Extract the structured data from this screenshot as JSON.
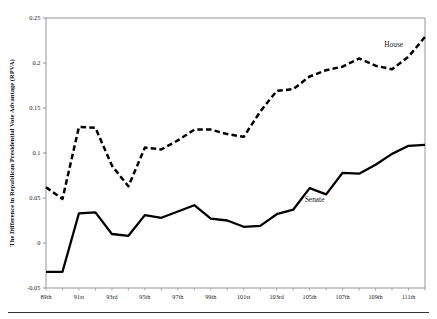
{
  "figure": {
    "name": "rpva-house-senate-line-chart",
    "bottom_rule": true
  },
  "chart_data": {
    "type": "line",
    "title": "",
    "subtitle": "",
    "xlabel": "",
    "ylabel": "The Difference in Republican Presidential Vote Advantage (RPVA)",
    "categories": [
      "89th",
      "90th",
      "91st",
      "92nd",
      "93rd",
      "94th",
      "95th",
      "96th",
      "97th",
      "98th",
      "99th",
      "100th",
      "101st",
      "102nd",
      "103rd",
      "104th",
      "105th",
      "106th",
      "107th",
      "108th",
      "109th",
      "110th",
      "111th",
      "112th"
    ],
    "x_tick_labels": [
      "89th",
      "91st",
      "93rd",
      "95th",
      "97th",
      "99th",
      "101st",
      "103rd",
      "105th",
      "107th",
      "109th",
      "111th"
    ],
    "x_tick_indices": [
      0,
      2,
      4,
      6,
      8,
      10,
      12,
      14,
      16,
      18,
      20,
      22
    ],
    "y_tick_labels": [
      "0.25",
      "0.2",
      "0.15",
      "0.1",
      "0.05",
      "0",
      "-0.05"
    ],
    "y_tick_values": [
      0.25,
      0.2,
      0.15,
      0.1,
      0.05,
      0,
      -0.05
    ],
    "ylim": [
      -0.05,
      0.25
    ],
    "grid": false,
    "legend_position": "inline-annotation",
    "series": [
      {
        "name": "House",
        "style": "dashed",
        "color": "#000000",
        "label_x_index": 21.1,
        "label_y": 0.218,
        "values": [
          0.062,
          0.049,
          0.129,
          0.128,
          0.086,
          0.063,
          0.106,
          0.104,
          0.114,
          0.126,
          0.126,
          0.121,
          0.118,
          0.146,
          0.169,
          0.171,
          0.185,
          0.192,
          0.196,
          0.205,
          0.197,
          0.193,
          0.207,
          0.229
        ]
      },
      {
        "name": "Senate",
        "style": "solid",
        "color": "#000000",
        "label_x_index": 16.3,
        "label_y": 0.046,
        "values": [
          -0.032,
          -0.032,
          0.033,
          0.034,
          0.01,
          0.008,
          0.031,
          0.028,
          0.035,
          0.042,
          0.027,
          0.025,
          0.018,
          0.019,
          0.032,
          0.037,
          0.061,
          0.054,
          0.078,
          0.077,
          0.087,
          0.099,
          0.108,
          0.109
        ]
      }
    ],
    "annotations": [
      {
        "text": "House",
        "series": "House"
      },
      {
        "text": "Senate",
        "series": "Senate"
      }
    ]
  }
}
